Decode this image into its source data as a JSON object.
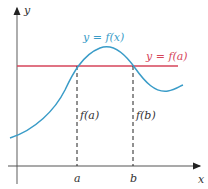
{
  "diagram": {
    "axes": {
      "x_label": "x",
      "y_label": "y"
    },
    "curve_label": "y = f(x)",
    "line_label": "y = f(a)",
    "points": {
      "a_label": "a",
      "b_label": "b",
      "fa_label": "f(a)",
      "fb_label": "f(b)"
    },
    "colors": {
      "curve": "#3a9cc8",
      "line": "#d6455a",
      "axis": "#333333"
    }
  }
}
